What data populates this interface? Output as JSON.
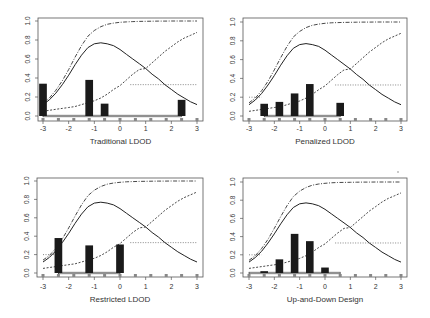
{
  "figure": {
    "panels_layout": "2x2",
    "stray_mark": {
      "x": 398,
      "y": 172
    }
  },
  "chart_data": [
    {
      "type": "bar+line",
      "title": "",
      "xlabel": "Traditional LDOD",
      "ylabel": "",
      "xlim": [
        -3,
        3
      ],
      "ylim": [
        0,
        1
      ],
      "xticks": [
        "-3",
        "-2",
        "-1",
        "0",
        "1",
        "2",
        "3"
      ],
      "yticks": [
        "0.0",
        "0.2",
        "0.4",
        "0.6",
        "0.8",
        "1.0"
      ],
      "design_points": [
        -3,
        -2.4,
        -1.8,
        -1.2,
        -0.6,
        0,
        0.6,
        1.2,
        1.8,
        2.4,
        3
      ],
      "bars": [
        {
          "x": -3,
          "height": 0.34
        },
        {
          "x": -1.2,
          "height": 0.38
        },
        {
          "x": -0.6,
          "height": 0.13
        },
        {
          "x": 2.4,
          "height": 0.17
        }
      ],
      "baseline_range": [
        -3,
        2.4
      ],
      "reference_lines": {
        "left_dotted": null,
        "right_dotted": {
          "y": 0.33,
          "from": 0.4,
          "to": 3
        }
      }
    },
    {
      "type": "bar+line",
      "title": "",
      "xlabel": "Penalized LDOD",
      "ylabel": "",
      "xlim": [
        -3,
        3
      ],
      "ylim": [
        0,
        1
      ],
      "xticks": [
        "-3",
        "-2",
        "-1",
        "0",
        "1",
        "2",
        "3"
      ],
      "yticks": [
        "0.0",
        "0.2",
        "0.4",
        "0.6",
        "0.8",
        "1.0"
      ],
      "design_points": [
        -3,
        -2.4,
        -1.8,
        -1.2,
        -0.6,
        0,
        0.6,
        1.2,
        1.8,
        2.4,
        3
      ],
      "bars": [
        {
          "x": -2.4,
          "height": 0.13
        },
        {
          "x": -1.8,
          "height": 0.15
        },
        {
          "x": -1.2,
          "height": 0.24
        },
        {
          "x": -0.6,
          "height": 0.34
        },
        {
          "x": 0.6,
          "height": 0.14
        }
      ],
      "baseline_range": [
        -2.4,
        0.6
      ],
      "reference_lines": {
        "left_dotted": {
          "y": 0.2,
          "from": -3,
          "to": -2.5
        },
        "right_dotted": {
          "y": 0.33,
          "from": 0.4,
          "to": 3
        }
      }
    },
    {
      "type": "bar+line",
      "title": "",
      "xlabel": "Restricted LDOD",
      "ylabel": "",
      "xlim": [
        -3,
        3
      ],
      "ylim": [
        0,
        1
      ],
      "xticks": [
        "-3",
        "-2",
        "-1",
        "0",
        "1",
        "2",
        "3"
      ],
      "yticks": [
        "0.0",
        "0.2",
        "0.4",
        "0.6",
        "0.8",
        "1.0"
      ],
      "design_points": [
        -3,
        -2.4,
        -1.8,
        -1.2,
        -0.6,
        0,
        0.6,
        1.2,
        1.8,
        2.4,
        3
      ],
      "bars": [
        {
          "x": -2.4,
          "height": 0.38
        },
        {
          "x": -1.2,
          "height": 0.3
        },
        {
          "x": 0,
          "height": 0.31
        }
      ],
      "baseline_range": [
        -2.4,
        0
      ],
      "reference_lines": {
        "left_dotted": {
          "y": 0.2,
          "from": -3,
          "to": -2.5
        },
        "right_dotted": {
          "y": 0.33,
          "from": 0.4,
          "to": 3
        }
      }
    },
    {
      "type": "bar+line",
      "title": "",
      "xlabel": "Up-and-Down Design",
      "ylabel": "",
      "xlim": [
        -3,
        3
      ],
      "ylim": [
        0,
        1
      ],
      "xticks": [
        "-3",
        "-2",
        "-1",
        "0",
        "1",
        "2",
        "3"
      ],
      "yticks": [
        "0.0",
        "0.2",
        "0.4",
        "0.6",
        "0.8",
        "1.0"
      ],
      "design_points": [
        -3,
        -2.4,
        -1.8,
        -1.2,
        -0.6,
        0,
        0.6,
        1.2,
        1.8,
        2.4,
        3
      ],
      "bars": [
        {
          "x": -2.4,
          "height": 0.02
        },
        {
          "x": -1.8,
          "height": 0.15
        },
        {
          "x": -1.2,
          "height": 0.43
        },
        {
          "x": -0.6,
          "height": 0.35
        },
        {
          "x": 0,
          "height": 0.06
        }
      ],
      "baseline_range": [
        -3,
        0.6
      ],
      "reference_lines": {
        "left_dotted": {
          "y": 0.2,
          "from": -3,
          "to": -2.5
        },
        "right_dotted": {
          "y": 0.33,
          "from": 0.4,
          "to": 3
        }
      }
    }
  ],
  "curves": {
    "x": [
      -3,
      -2.75,
      -2.5,
      -2.25,
      -2,
      -1.75,
      -1.5,
      -1.25,
      -1,
      -0.75,
      -0.5,
      -0.25,
      0,
      0.25,
      0.5,
      0.75,
      1,
      1.25,
      1.5,
      1.75,
      2,
      2.25,
      2.5,
      2.75,
      3
    ],
    "solid": [
      0.12,
      0.17,
      0.24,
      0.33,
      0.43,
      0.54,
      0.64,
      0.72,
      0.76,
      0.77,
      0.76,
      0.74,
      0.7,
      0.65,
      0.6,
      0.55,
      0.5,
      0.44,
      0.39,
      0.33,
      0.28,
      0.23,
      0.19,
      0.15,
      0.12
    ],
    "dashdot": [
      0.14,
      0.19,
      0.27,
      0.37,
      0.49,
      0.62,
      0.74,
      0.84,
      0.9,
      0.94,
      0.965,
      0.978,
      0.986,
      0.991,
      0.994,
      0.996,
      0.997,
      0.998,
      0.999,
      0.999,
      1.0,
      1.0,
      1.0,
      1.0,
      1.0
    ],
    "dashed": [
      0.05,
      0.06,
      0.07,
      0.08,
      0.09,
      0.1,
      0.12,
      0.14,
      0.16,
      0.19,
      0.23,
      0.28,
      0.32,
      0.38,
      0.44,
      0.49,
      0.5,
      0.56,
      0.62,
      0.68,
      0.73,
      0.78,
      0.82,
      0.85,
      0.88
    ],
    "legend": [
      "solid",
      "dash-dot",
      "dashed",
      "dotted"
    ]
  },
  "panel_geometry": [
    {
      "left": 38,
      "top": 18,
      "right": 203,
      "bottom": 121,
      "x0": 43,
      "x1": 197,
      "y0": 116,
      "y1": 21,
      "tick_label_y": 131,
      "xlabel_y": 144,
      "ylabel_x": 28
    },
    {
      "left": 243,
      "top": 18,
      "right": 407,
      "bottom": 121,
      "x0": 249,
      "x1": 401,
      "y0": 116,
      "y1": 22,
      "tick_label_y": 131,
      "xlabel_y": 144,
      "ylabel_x": 233
    },
    {
      "left": 37,
      "top": 178,
      "right": 203,
      "bottom": 277,
      "x0": 43,
      "x1": 197,
      "y0": 273,
      "y1": 181,
      "tick_label_y": 289,
      "xlabel_y": 302,
      "ylabel_x": 27
    },
    {
      "left": 243,
      "top": 178,
      "right": 407,
      "bottom": 277,
      "x0": 249,
      "x1": 401,
      "y0": 273,
      "y1": 182,
      "tick_label_y": 289,
      "xlabel_y": 302,
      "ylabel_x": 233
    }
  ]
}
